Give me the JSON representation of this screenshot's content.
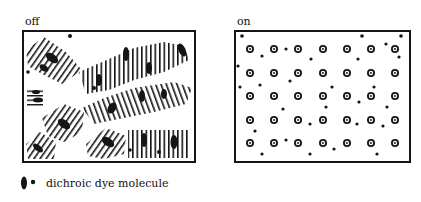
{
  "panels": {
    "off": {
      "label": "off"
    },
    "on": {
      "label": "on"
    }
  },
  "legend": {
    "text": "dichroic dye molecule",
    "icon": "dye-molecule-ellipse-and-dot"
  },
  "colors": {
    "ink": "#151515",
    "background": "#ffffff"
  }
}
